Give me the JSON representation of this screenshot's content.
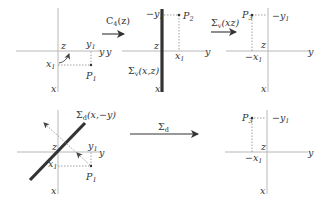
{
  "diagram": {
    "panels": [
      {
        "id": "panel-1",
        "axes": {
          "horizontal": "y",
          "vertical": "x",
          "origin": "z"
        },
        "labels": {
          "x1": "x",
          "x1_sub": "1",
          "y1": "y",
          "y1_sub": "1",
          "point": "P",
          "point_sub": "1",
          "z": "z",
          "y": "y",
          "x": "x"
        },
        "has_rotation_arrow": true
      },
      {
        "id": "panel-2",
        "axes": {
          "horizontal": "y",
          "vertical": "x",
          "origin": "z"
        },
        "labels": {
          "neg_y1": "−y",
          "neg_y1_sub": "1",
          "x1": "x",
          "x1_sub": "1",
          "point": "P",
          "point_sub": "2",
          "z": "z",
          "y": "y",
          "x": "x"
        },
        "mirror_plane": {
          "symbol": "Σ",
          "sub": "v",
          "args": "(x,z)"
        }
      },
      {
        "id": "panel-3",
        "axes": {
          "horizontal": "y",
          "vertical": "x",
          "origin": "z"
        },
        "labels": {
          "neg_y1": "−y",
          "neg_y1_sub": "1",
          "neg_x1": "−x",
          "neg_x1_sub": "1",
          "point": "P",
          "point_sub": "3",
          "z": "z",
          "y": "y",
          "x": "x"
        }
      },
      {
        "id": "panel-4",
        "axes": {
          "horizontal": "y",
          "vertical": "x",
          "origin": "z"
        },
        "labels": {
          "x1": "x",
          "x1_sub": "1",
          "y1": "y",
          "y1_sub": "1",
          "point": "P",
          "point_sub": "1",
          "z": "z",
          "y": "y",
          "x": "x"
        },
        "mirror_plane": {
          "symbol": "Σ",
          "sub": "d",
          "args": "(x,−y)"
        }
      },
      {
        "id": "panel-5",
        "axes": {
          "horizontal": "y",
          "vertical": "x",
          "origin": "z"
        },
        "labels": {
          "neg_y1": "−y",
          "neg_y1_sub": "1",
          "neg_x1": "−x",
          "neg_x1_sub": "1",
          "point": "P",
          "point_sub": "3",
          "z": "z",
          "y": "y",
          "x": "x"
        }
      }
    ],
    "operations": [
      {
        "id": "op-1",
        "symbol": "C",
        "sub": "4",
        "args": "(z)",
        "from": "panel-1",
        "to": "panel-2"
      },
      {
        "id": "op-2",
        "symbol": "Σ",
        "sub": "v",
        "args": "(xz)",
        "from": "panel-2",
        "to": "panel-3"
      },
      {
        "id": "op-3",
        "symbol": "Σ",
        "sub": "d",
        "args": "",
        "from": "panel-4",
        "to": "panel-5"
      }
    ],
    "colors": {
      "axis": "#b8b8b8",
      "ink": "#333333",
      "mirror": "#333333"
    }
  }
}
